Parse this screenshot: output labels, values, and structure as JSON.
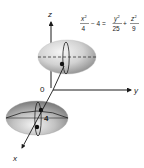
{
  "figure": {
    "type": "3d-surface-sketch",
    "surface": "hyperboloid of two sheets",
    "equation": {
      "lhs_fraction": {
        "numerator": "x",
        "exponent": "2",
        "denominator": "4"
      },
      "lhs_minus": "− 4 =",
      "rhs_fraction_1": {
        "numerator": "y",
        "exponent": "2",
        "denominator": "25"
      },
      "plus": "+",
      "rhs_fraction_2": {
        "numerator": "z",
        "exponent": "2",
        "denominator": "9"
      }
    },
    "axes": {
      "x_label": "x",
      "y_label": "y",
      "z_label": "z",
      "origin_label": "0"
    },
    "annotations": {
      "vertex_distance_label": "4"
    },
    "colors": {
      "axis": "#1a1a1a",
      "surface_light": "#f0f0f0",
      "surface_dark": "#8a8a8a",
      "outline": "#222222"
    }
  }
}
